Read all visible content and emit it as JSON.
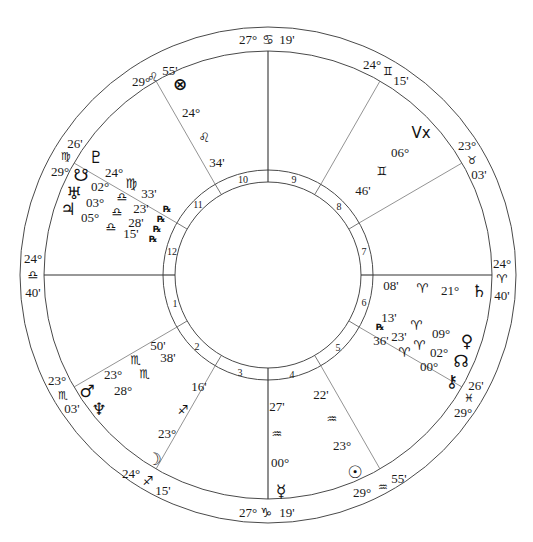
{
  "chart": {
    "type": "natal-wheel",
    "center": [
      268,
      275
    ],
    "radii": {
      "outer": 248,
      "zodiac_inner": 224,
      "house_ring_outer": 105,
      "inner": 93
    },
    "colors": {
      "line": "#4a4a4a",
      "text": "#1a1a1a",
      "background": "#ffffff"
    }
  },
  "houses": [
    {
      "n": "1",
      "label": "1"
    },
    {
      "n": "2",
      "label": "2"
    },
    {
      "n": "3",
      "label": "3"
    },
    {
      "n": "4",
      "label": "4"
    },
    {
      "n": "5",
      "label": "5"
    },
    {
      "n": "6",
      "label": "6"
    },
    {
      "n": "7",
      "label": "7"
    },
    {
      "n": "8",
      "label": "8"
    },
    {
      "n": "9",
      "label": "9"
    },
    {
      "n": "10",
      "label": "10"
    },
    {
      "n": "11",
      "label": "11"
    },
    {
      "n": "12",
      "label": "12"
    }
  ],
  "cusps": {
    "mc": {
      "deg": "27°",
      "sign": "♋",
      "min": "19'"
    },
    "c11": {
      "deg": "29°",
      "sign": "♌",
      "min": "55'"
    },
    "c12": {
      "deg": "29°",
      "sign": "♍",
      "min": "26'"
    },
    "asc": {
      "deg": "24°",
      "sign": "♎",
      "min": "40'"
    },
    "c2": {
      "deg": "23°",
      "sign": "♏",
      "min": "03'"
    },
    "c3": {
      "deg": "24°",
      "sign": "♐",
      "min": "15'"
    },
    "ic": {
      "deg": "27°",
      "sign": "♑",
      "min": "19'"
    },
    "c5": {
      "deg": "29°",
      "sign": "♒",
      "min": "55'"
    },
    "c6": {
      "deg": "29°",
      "sign": "♓",
      "min": "26'"
    },
    "dsc": {
      "deg": "24°",
      "sign": "♈",
      "min": "40'"
    },
    "c8": {
      "deg": "23°",
      "sign": "♉",
      "min": "03'"
    },
    "c9": {
      "deg": "24°",
      "sign": "♊",
      "min": "15'"
    }
  },
  "planets": {
    "fortune": {
      "glyph": "⊗",
      "deg": "24°",
      "sign": "♌",
      "min": "34'"
    },
    "vertex": {
      "glyph": "Vx",
      "deg": "06°",
      "sign": "♊",
      "min": "46'"
    },
    "pluto": {
      "glyph": "♇",
      "deg": "24°",
      "sign": "♍",
      "min": "33'",
      "rx": "℞"
    },
    "southnode": {
      "glyph": "☋",
      "deg": "02°",
      "sign": "♎",
      "min": "23'",
      "rx": "℞"
    },
    "uranus": {
      "glyph": "♅",
      "deg": "03°",
      "sign": "♎",
      "min": "28'",
      "rx": "℞"
    },
    "jupiter": {
      "glyph": "♃",
      "deg": "05°",
      "sign": "♎",
      "min": "15'",
      "rx": "℞"
    },
    "mars": {
      "glyph": "♂",
      "deg": "23°",
      "sign": "♏",
      "min": "50'"
    },
    "neptune": {
      "glyph": "♆",
      "deg": "28°",
      "sign": "♏",
      "min": "38'"
    },
    "moon": {
      "glyph": "☽",
      "deg": "23°",
      "sign": "♐",
      "min": "16'"
    },
    "mercury": {
      "glyph": "☿",
      "deg": "00°",
      "sign": "♒",
      "min": "27'"
    },
    "sun": {
      "glyph": "☉",
      "deg": "23°",
      "sign": "♒",
      "min": "22'"
    },
    "saturn": {
      "glyph": "♄",
      "deg": "21°",
      "sign": "♈",
      "min": "08'"
    },
    "venus": {
      "glyph": "♀",
      "deg": "09°",
      "sign": "♈",
      "min": "13'"
    },
    "northnode": {
      "glyph": "☊",
      "deg": "02°",
      "sign": "♈",
      "min": "23'",
      "rx": "℞"
    },
    "chiron": {
      "glyph": "⚷",
      "deg": "00°",
      "sign": "♈",
      "min": "36'"
    }
  }
}
